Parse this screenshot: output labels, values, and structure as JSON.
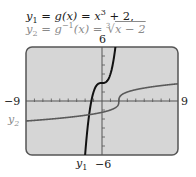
{
  "equations": {
    "line1": {
      "lhs": "y",
      "sub": "1",
      "mid": " = g(x) = x",
      "sup": "3",
      "rhs": " + 2,"
    },
    "line2": {
      "lhs": "y",
      "sub": "2",
      "mid": " = g",
      "sup": "−1",
      "mid2": "(x) = ",
      "root_index": "3",
      "radical": "√",
      "radicand": "x − 2"
    }
  },
  "labels": {
    "ymax": "6",
    "ymin": "−6",
    "xmin": "−9",
    "xmax": "9",
    "y1_label": "y",
    "y1_sub": "1",
    "y2_label": "y",
    "y2_sub": "2"
  },
  "colors": {
    "plot_bg": "#d6d6d6",
    "frame": "#555555",
    "axis": "#555555",
    "y1_curve": "#111111",
    "y2_curve": "#5a5a5a",
    "label_gray": "#8a8a8a"
  },
  "chart_data": {
    "type": "line",
    "xlabel": "",
    "ylabel": "",
    "xlim": [
      -9,
      9
    ],
    "ylim": [
      -6,
      6
    ],
    "x_ticks_step": 1,
    "y_ticks_step": 1,
    "grid": false,
    "legend": "inline labels (y1 below plot, y2 left of plot)",
    "series": [
      {
        "name": "y1",
        "expression": "x^3 + 2",
        "x": [
          -2.0,
          -1.8,
          -1.5,
          -1.2,
          -1.0,
          -0.5,
          0,
          0.5,
          1.0,
          1.2,
          1.5,
          1.59
        ],
        "values": [
          -6.0,
          -3.83,
          -1.38,
          0.27,
          1.0,
          1.88,
          2.0,
          2.13,
          3.0,
          3.73,
          5.38,
          6.0
        ]
      },
      {
        "name": "y2",
        "expression": "cbrt(x - 2)",
        "x": [
          -9,
          -6,
          -3,
          0,
          1,
          1.5,
          2,
          2.5,
          3,
          5,
          9
        ],
        "values": [
          -2.22,
          -2.0,
          -1.71,
          -1.26,
          -1.0,
          -0.79,
          0,
          0.79,
          1.0,
          1.44,
          1.91
        ]
      }
    ]
  }
}
